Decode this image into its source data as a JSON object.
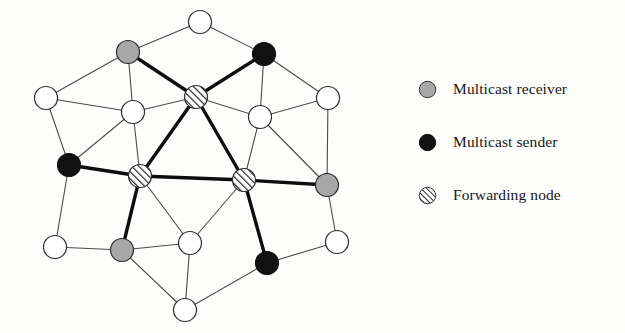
{
  "figure": {
    "background_color": "#fdfdfc"
  },
  "style": {
    "node_radius": 11.5,
    "legend_marker_radius": 9.5,
    "colors": {
      "receiver_fill": "#a8a8a8",
      "sender_fill": "#111111",
      "forwarding_fill": "#ffffff",
      "forwarding_hatch": "#1a1a1a",
      "plain_fill": "#ffffff",
      "node_stroke": "#2b2b2b",
      "topology_edge": "#4a4a4a",
      "tree_edge": "#0d0d0d"
    },
    "edge_widths": {
      "topology": 1.1,
      "tree": 3.4
    }
  },
  "legend": {
    "items": [
      {
        "id": "receiver",
        "marker": "gray-filled-circle",
        "label": "Multicast receiver"
      },
      {
        "id": "sender",
        "marker": "black-filled-circle",
        "label": "Multicast sender"
      },
      {
        "id": "forwarding",
        "marker": "hatched-circle",
        "label": "Forwarding node"
      }
    ]
  },
  "graph": {
    "node_types": {
      "receiver": "Multicast receiver",
      "sender": "Multicast sender",
      "forwarding": "Forwarding node",
      "plain": "Network node"
    },
    "nodes": [
      {
        "id": "n1",
        "type": "plain",
        "x": 200,
        "y": 22
      },
      {
        "id": "n2",
        "type": "receiver",
        "x": 128,
        "y": 52
      },
      {
        "id": "n3",
        "type": "sender",
        "x": 264,
        "y": 54
      },
      {
        "id": "n4",
        "type": "plain",
        "x": 46,
        "y": 98
      },
      {
        "id": "n5",
        "type": "plain",
        "x": 133,
        "y": 112
      },
      {
        "id": "n6",
        "type": "forwarding",
        "x": 196,
        "y": 97
      },
      {
        "id": "n7",
        "type": "plain",
        "x": 260,
        "y": 117
      },
      {
        "id": "n8",
        "type": "plain",
        "x": 328,
        "y": 98
      },
      {
        "id": "n9",
        "type": "sender",
        "x": 69,
        "y": 165
      },
      {
        "id": "n10",
        "type": "forwarding",
        "x": 140,
        "y": 176
      },
      {
        "id": "n11",
        "type": "forwarding",
        "x": 244,
        "y": 180
      },
      {
        "id": "n12",
        "type": "receiver",
        "x": 327,
        "y": 185
      },
      {
        "id": "n13",
        "type": "plain",
        "x": 55,
        "y": 247
      },
      {
        "id": "n14",
        "type": "receiver",
        "x": 122,
        "y": 250
      },
      {
        "id": "n15",
        "type": "plain",
        "x": 190,
        "y": 243
      },
      {
        "id": "n16",
        "type": "sender",
        "x": 267,
        "y": 263
      },
      {
        "id": "n17",
        "type": "plain",
        "x": 337,
        "y": 242
      },
      {
        "id": "n18",
        "type": "plain",
        "x": 185,
        "y": 310
      }
    ],
    "topology_edges": [
      [
        "n1",
        "n2"
      ],
      [
        "n1",
        "n3"
      ],
      [
        "n2",
        "n4"
      ],
      [
        "n2",
        "n5"
      ],
      [
        "n4",
        "n5"
      ],
      [
        "n4",
        "n9"
      ],
      [
        "n5",
        "n6"
      ],
      [
        "n5",
        "n9"
      ],
      [
        "n5",
        "n10"
      ],
      [
        "n3",
        "n7"
      ],
      [
        "n3",
        "n8"
      ],
      [
        "n6",
        "n7"
      ],
      [
        "n7",
        "n8"
      ],
      [
        "n7",
        "n11"
      ],
      [
        "n7",
        "n12"
      ],
      [
        "n8",
        "n12"
      ],
      [
        "n9",
        "n13"
      ],
      [
        "n10",
        "n14"
      ],
      [
        "n10",
        "n15"
      ],
      [
        "n11",
        "n15"
      ],
      [
        "n11",
        "n16"
      ],
      [
        "n11",
        "n12"
      ],
      [
        "n12",
        "n17"
      ],
      [
        "n13",
        "n14"
      ],
      [
        "n14",
        "n15"
      ],
      [
        "n14",
        "n18"
      ],
      [
        "n15",
        "n18"
      ],
      [
        "n16",
        "n17"
      ],
      [
        "n16",
        "n18"
      ]
    ],
    "tree_edges": [
      [
        "n2",
        "n6"
      ],
      [
        "n3",
        "n6"
      ],
      [
        "n6",
        "n10"
      ],
      [
        "n6",
        "n11"
      ],
      [
        "n9",
        "n10"
      ],
      [
        "n10",
        "n11"
      ],
      [
        "n10",
        "n14"
      ],
      [
        "n11",
        "n12"
      ],
      [
        "n11",
        "n16"
      ]
    ]
  }
}
